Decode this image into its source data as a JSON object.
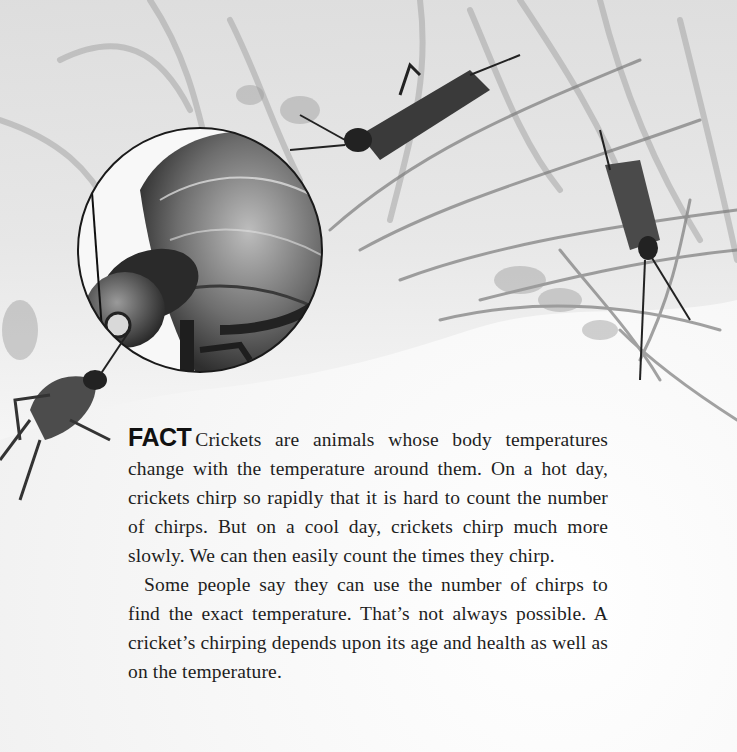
{
  "illustration": {
    "description": "Watercolor illustration of crickets in tall grass with a circular magnified inset of a cricket's head and body",
    "elements": [
      {
        "name": "magnified-cricket-inset",
        "shape": "circle"
      },
      {
        "name": "cricket-top-center"
      },
      {
        "name": "cricket-right"
      },
      {
        "name": "cricket-bottom-left"
      },
      {
        "name": "grass-background"
      }
    ],
    "colors": {
      "paper": "#f4f4f4",
      "ink": "#1e1e1e",
      "grass_mid": "#9a9a9a",
      "grass_dark": "#4a4a4a"
    }
  },
  "article": {
    "label": "FACT",
    "paragraphs": [
      "Crickets are animals whose body temperatures change with the temperature around them. On a hot day, crickets chirp so rapidly that it is hard to count the number of chirps. But on a cool day, crickets chirp much more slowly. We can then easily count the times they chirp.",
      "Some people say they can use the number of chirps to find the exact temperature. That’s not always possible. A cricket’s chirping depends upon its age and health as well as on the temperature."
    ]
  }
}
